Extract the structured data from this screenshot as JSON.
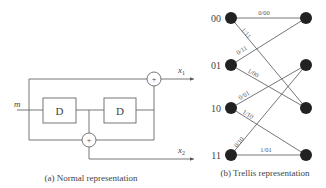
{
  "normal": {
    "input_label": "m",
    "delay_labels": [
      "D",
      "D"
    ],
    "adder_symbol": "+",
    "output1_label": "x",
    "output1_sub": "1",
    "output2_label": "x",
    "output2_sub": "2",
    "caption": "(a) Normal representation"
  },
  "trellis": {
    "states": [
      "00",
      "01",
      "10",
      "11"
    ],
    "edges": [
      {
        "from": "00",
        "to": "00",
        "label": "0/00"
      },
      {
        "from": "00",
        "to": "10",
        "label": "1/11"
      },
      {
        "from": "01",
        "to": "00",
        "label": "0/11"
      },
      {
        "from": "01",
        "to": "10",
        "label": "1/00"
      },
      {
        "from": "10",
        "to": "01",
        "label": "0/01"
      },
      {
        "from": "10",
        "to": "11",
        "label": "1/10"
      },
      {
        "from": "11",
        "to": "01",
        "label": "0/10"
      },
      {
        "from": "11",
        "to": "11",
        "label": "1/01"
      }
    ],
    "caption": "(b) Trellis representation"
  }
}
